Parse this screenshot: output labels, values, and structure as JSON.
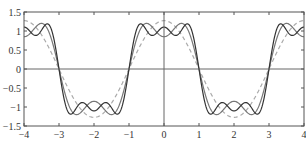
{
  "chart_data": {
    "type": "line",
    "title": "",
    "xlabel": "",
    "ylabel": "",
    "xlim": [
      -4,
      4
    ],
    "ylim": [
      -1.5,
      1.5
    ],
    "grid": false,
    "legend": null,
    "x_ticks": [
      "-4",
      "-3",
      "-2",
      "-1",
      "0",
      "1",
      "2",
      "3",
      "4"
    ],
    "y_ticks": [
      "1.5",
      "1",
      "0.5",
      "0",
      "-0.5",
      "-1",
      "-1.5"
    ],
    "series": [
      {
        "name": "1 term",
        "style": "dashed",
        "color": "#aaaaaa",
        "terms": 1,
        "x": [
          -4,
          -3,
          -2,
          -1,
          0,
          1,
          2,
          3,
          4
        ],
        "values": [
          1.27,
          0,
          -1.27,
          0,
          1.27,
          0,
          -1.27,
          0,
          1.27
        ]
      },
      {
        "name": "2 terms",
        "style": "solid",
        "color": "#777777",
        "terms": 2,
        "x": [
          -4,
          -3,
          -2,
          -1,
          0,
          1,
          2,
          3,
          4
        ],
        "values": [
          0.85,
          0,
          -0.85,
          0,
          0.85,
          0,
          -0.85,
          0,
          0.85
        ]
      },
      {
        "name": "3 terms",
        "style": "solid",
        "color": "#333333",
        "terms": 3,
        "x": [
          -4,
          -3,
          -2,
          -1,
          0,
          1,
          2,
          3,
          4
        ],
        "values": [
          1.1,
          0,
          -1.1,
          0,
          1.1,
          0,
          -1.1,
          0,
          1.1
        ]
      }
    ]
  },
  "colors": {
    "frame": "#555555",
    "zero_line": "#666666",
    "background": "#ffffff"
  }
}
